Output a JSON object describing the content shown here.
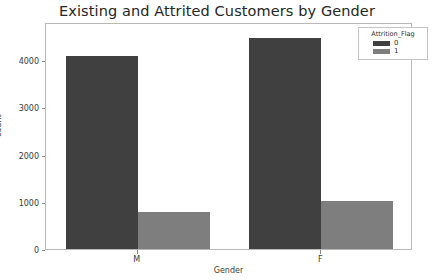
{
  "chart_data": {
    "type": "bar",
    "title": "Existing and Attrited Customers by Gender",
    "xlabel": "Gender",
    "ylabel": "count",
    "categories": [
      "M",
      "F"
    ],
    "series": [
      {
        "name": "0",
        "values": [
          4085,
          4465
        ],
        "color": "#404040"
      },
      {
        "name": "1",
        "values": [
          780,
          1015
        ],
        "color": "#7e7e7e"
      }
    ],
    "legend": {
      "title": "Attrition_Flag",
      "position": "top-right",
      "entries": [
        {
          "label": "0",
          "color": "#404040"
        },
        {
          "label": "1",
          "color": "#7e7e7e"
        }
      ]
    },
    "ylim": [
      0,
      4805
    ],
    "yticks": [
      0,
      1000,
      2000,
      3000,
      4000
    ],
    "ytick_labels": [
      "0",
      "1000",
      "2000",
      "3000",
      "4000"
    ],
    "xtick_labels": [
      "M",
      "F"
    ],
    "grid": false,
    "bar_mode": "grouped"
  },
  "figure": {
    "background": "#ffffff",
    "axes_edge_color": "#b8b8b8",
    "tick_color": "#8a8a8a",
    "text_color": "#3a3a3a",
    "title_color": "#262626"
  }
}
